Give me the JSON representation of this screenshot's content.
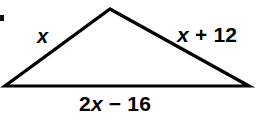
{
  "figure": {
    "name": "triangle-side-lengths-diagram",
    "background_color": "#ffffff",
    "stroke_color": "#000000",
    "width": 257,
    "height": 122
  },
  "triangle": {
    "apex": {
      "x": 110,
      "y": 9
    },
    "bottom_left": {
      "x": 5,
      "y": 86
    },
    "bottom_right": {
      "x": 249,
      "y": 86
    },
    "stroke_width": 3.2
  },
  "labels": {
    "left_side": {
      "full_text": "x",
      "variable": "x",
      "operator": "",
      "constant": ""
    },
    "right_side": {
      "full_text": "x + 12",
      "variable": "x",
      "operator": " + ",
      "constant": "12"
    },
    "bottom_side": {
      "full_text": "2x − 16",
      "coefficient": "2",
      "variable": "x",
      "operator": " − ",
      "constant": "16"
    }
  }
}
